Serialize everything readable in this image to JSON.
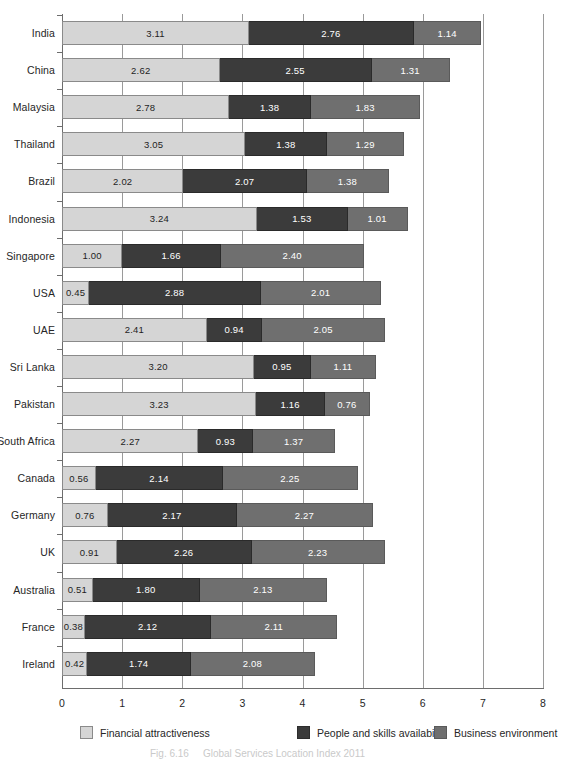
{
  "chart_data": {
    "type": "bar",
    "orientation": "horizontal",
    "stacked": true,
    "title": "",
    "xlabel": "",
    "ylabel": "",
    "xlim": [
      0,
      8
    ],
    "xticks": [
      "0",
      "1",
      "2",
      "3",
      "4",
      "5",
      "6",
      "7",
      "8"
    ],
    "grid": "vertical",
    "legend_position": "bottom",
    "categories": [
      "India",
      "China",
      "Malaysia",
      "Thailand",
      "Brazil",
      "Indonesia",
      "Singapore",
      "USA",
      "UAE",
      "Sri Lanka",
      "Pakistan",
      "South Africa",
      "Canada",
      "Germany",
      "UK",
      "Australia",
      "France",
      "Ireland"
    ],
    "series": [
      {
        "name": "Financial attractiveness",
        "color": "#d5d5d5",
        "values": [
          3.11,
          2.62,
          2.78,
          3.05,
          2.02,
          3.24,
          1.0,
          0.45,
          2.41,
          3.2,
          3.23,
          2.27,
          0.56,
          0.76,
          0.91,
          0.51,
          0.38,
          0.42
        ]
      },
      {
        "name": "People and skills availabilty",
        "color": "#3b3b3b",
        "values": [
          2.76,
          2.55,
          1.38,
          1.38,
          2.07,
          1.53,
          1.66,
          2.88,
          0.94,
          0.95,
          1.16,
          0.93,
          2.14,
          2.17,
          2.26,
          1.8,
          2.12,
          1.74
        ]
      },
      {
        "name": "Business environment",
        "color": "#6f6f6f",
        "values": [
          1.14,
          1.31,
          1.83,
          1.29,
          1.38,
          1.01,
          2.4,
          2.01,
          2.05,
          1.11,
          0.76,
          1.37,
          2.25,
          2.27,
          2.23,
          2.13,
          2.11,
          2.08
        ]
      }
    ],
    "totals": [
      7.01,
      6.48,
      5.99,
      5.72,
      5.47,
      5.78,
      5.06,
      5.34,
      5.4,
      5.26,
      5.15,
      4.57,
      4.95,
      5.2,
      5.4,
      4.44,
      4.61,
      4.24
    ]
  },
  "legend": {
    "items": [
      {
        "label": "Financial attractiveness",
        "swatch": "sw-1"
      },
      {
        "label": "People and skills availabilty",
        "swatch": "sw-2"
      },
      {
        "label": "Business environment",
        "swatch": "sw-3"
      }
    ]
  },
  "caption": {
    "number": "Fig. 6.16",
    "text": "Global Services Location Index 2011"
  }
}
